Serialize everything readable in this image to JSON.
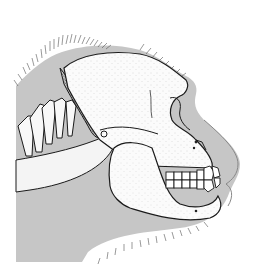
{
  "image": {
    "subject": "Lateral view of an ape (gorilla) skull and cervical vertebrae inside the silhouette of the head",
    "width": 256,
    "height": 268
  },
  "colors": {
    "background": "#ffffff",
    "head_silhouette": "#c8c8c8",
    "bone": "#fafafa",
    "outline": "#1a1a1a",
    "hair": "#555555",
    "stipple": "#777777"
  },
  "parts": [
    "head-silhouette",
    "hair-fringe",
    "cranium",
    "brow-ridge",
    "mandible",
    "teeth",
    "cervical-vertebrae",
    "nuchal-muscle"
  ]
}
